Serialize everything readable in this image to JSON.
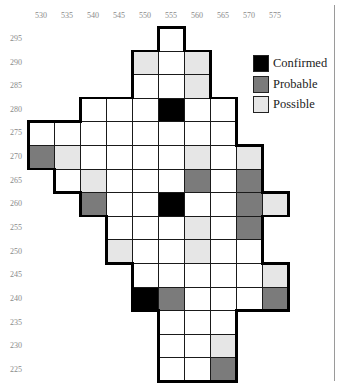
{
  "map": {
    "x_labels": [
      "530",
      "535",
      "540",
      "545",
      "550",
      "555",
      "560",
      "565",
      "570",
      "575"
    ],
    "y_labels": [
      "295",
      "290",
      "285",
      "280",
      "275",
      "270",
      "265",
      "260",
      "255",
      "250",
      "245",
      "240",
      "235",
      "230",
      "225"
    ],
    "status_key": {
      "W": "unsurveyed/absent",
      "B": "Confirmed",
      "G": "Probable",
      "L": "Possible"
    },
    "rows": [
      {
        "y": "295",
        "cells": {
          "555": "W"
        }
      },
      {
        "y": "290",
        "cells": {
          "550": "L",
          "555": "W",
          "560": "L"
        }
      },
      {
        "y": "285",
        "cells": {
          "550": "W",
          "555": "W",
          "560": "L"
        }
      },
      {
        "y": "280",
        "cells": {
          "540": "W",
          "545": "W",
          "550": "W",
          "555": "B",
          "560": "W",
          "565": "W"
        }
      },
      {
        "y": "275",
        "cells": {
          "530": "W",
          "535": "W",
          "540": "W",
          "545": "W",
          "550": "W",
          "555": "W",
          "560": "W",
          "565": "W"
        }
      },
      {
        "y": "270",
        "cells": {
          "530": "G",
          "535": "L",
          "540": "W",
          "545": "W",
          "550": "W",
          "555": "W",
          "560": "L",
          "565": "W",
          "570": "L"
        }
      },
      {
        "y": "265",
        "cells": {
          "535": "W",
          "540": "L",
          "545": "W",
          "550": "W",
          "555": "W",
          "560": "G",
          "565": "W",
          "570": "G"
        }
      },
      {
        "y": "260",
        "cells": {
          "540": "G",
          "545": "W",
          "550": "W",
          "555": "B",
          "560": "W",
          "565": "W",
          "570": "G",
          "575": "L"
        }
      },
      {
        "y": "255",
        "cells": {
          "545": "W",
          "550": "W",
          "555": "W",
          "560": "L",
          "565": "W",
          "570": "G"
        }
      },
      {
        "y": "250",
        "cells": {
          "545": "L",
          "550": "W",
          "555": "W",
          "560": "L",
          "565": "W",
          "570": "W"
        }
      },
      {
        "y": "245",
        "cells": {
          "550": "W",
          "555": "W",
          "560": "W",
          "565": "W",
          "570": "W",
          "575": "L"
        }
      },
      {
        "y": "240",
        "cells": {
          "550": "B",
          "555": "G",
          "560": "W",
          "565": "W",
          "570": "W",
          "575": "G"
        }
      },
      {
        "y": "235",
        "cells": {
          "555": "W",
          "560": "W",
          "565": "W"
        }
      },
      {
        "y": "230",
        "cells": {
          "555": "W",
          "560": "W",
          "565": "L"
        }
      },
      {
        "y": "225",
        "cells": {
          "555": "W",
          "560": "W",
          "565": "G"
        }
      }
    ]
  },
  "legend": {
    "items": [
      {
        "label": "Confirmed",
        "code": "B",
        "color": "#000000"
      },
      {
        "label": "Probable",
        "code": "G",
        "color": "#7b7b7b"
      },
      {
        "label": "Possible",
        "code": "L",
        "color": "#e6e6e6"
      }
    ]
  },
  "colors": {
    "W": "#ffffff",
    "B": "#000000",
    "G": "#7b7b7b",
    "L": "#e6e6e6",
    "grid_line": "#1a1a1a",
    "label_text": "#8a8a8a"
  }
}
